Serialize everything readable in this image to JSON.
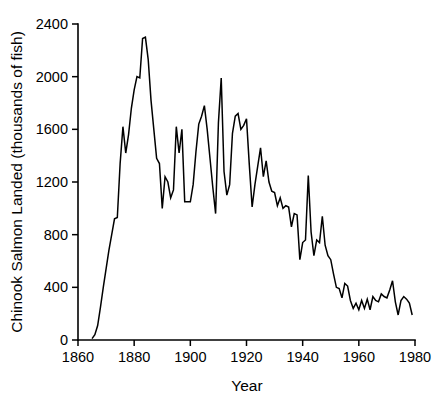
{
  "chart_data": {
    "type": "line",
    "title": "",
    "subtitle": "",
    "xlabel": "Year",
    "ylabel": "Chinook Salmon Landed (thousands of fish)",
    "xlim": [
      1860,
      1980
    ],
    "ylim": [
      0,
      2400
    ],
    "xticks": [
      1860,
      1880,
      1900,
      1920,
      1940,
      1960,
      1980
    ],
    "yticks": [
      0,
      400,
      800,
      1200,
      1600,
      2000,
      2400
    ],
    "xtick_labels": [
      "1860",
      "1880",
      "1900",
      "1920",
      "1940",
      "1960",
      "1980"
    ],
    "ytick_labels": [
      "0",
      "400",
      "800",
      "1200",
      "1600",
      "2000",
      "2400"
    ],
    "grid": false,
    "legend": null,
    "legend_position": "none",
    "line_color": "#000000",
    "background_color": "#ffffff",
    "series": [
      {
        "name": "Chinook Salmon Landed",
        "units": "thousands of fish",
        "x": [
          1865,
          1866,
          1867,
          1868,
          1869,
          1870,
          1871,
          1872,
          1873,
          1874,
          1875,
          1876,
          1877,
          1878,
          1879,
          1880,
          1881,
          1882,
          1883,
          1884,
          1885,
          1886,
          1887,
          1888,
          1889,
          1890,
          1891,
          1892,
          1893,
          1894,
          1895,
          1896,
          1897,
          1898,
          1899,
          1900,
          1901,
          1902,
          1903,
          1904,
          1905,
          1906,
          1907,
          1908,
          1909,
          1910,
          1911,
          1912,
          1913,
          1914,
          1915,
          1916,
          1917,
          1918,
          1919,
          1920,
          1921,
          1922,
          1923,
          1924,
          1925,
          1926,
          1927,
          1928,
          1929,
          1930,
          1931,
          1932,
          1933,
          1934,
          1935,
          1936,
          1937,
          1938,
          1939,
          1940,
          1941,
          1942,
          1943,
          1944,
          1945,
          1946,
          1947,
          1948,
          1949,
          1950,
          1951,
          1952,
          1953,
          1954,
          1955,
          1956,
          1957,
          1958,
          1959,
          1960,
          1961,
          1962,
          1963,
          1964,
          1965,
          1966,
          1967,
          1968,
          1969,
          1970,
          1971,
          1972,
          1973,
          1974,
          1975,
          1976,
          1977,
          1978,
          1979
        ],
        "values": [
          10,
          40,
          110,
          250,
          400,
          540,
          680,
          800,
          920,
          930,
          1340,
          1620,
          1420,
          1560,
          1760,
          1900,
          2000,
          1990,
          2290,
          2300,
          2130,
          1820,
          1600,
          1380,
          1340,
          1000,
          1240,
          1200,
          1080,
          1140,
          1620,
          1420,
          1600,
          1050,
          1050,
          1050,
          1180,
          1430,
          1640,
          1700,
          1780,
          1600,
          1380,
          1160,
          960,
          1650,
          1990,
          1280,
          1100,
          1180,
          1570,
          1700,
          1720,
          1600,
          1630,
          1680,
          1330,
          1010,
          1180,
          1320,
          1460,
          1240,
          1360,
          1200,
          1130,
          1120,
          1020,
          1080,
          1000,
          1020,
          1010,
          860,
          960,
          950,
          610,
          740,
          760,
          1250,
          820,
          640,
          760,
          740,
          940,
          720,
          640,
          610,
          500,
          400,
          390,
          320,
          430,
          410,
          300,
          240,
          280,
          230,
          300,
          240,
          310,
          230,
          330,
          300,
          290,
          350,
          330,
          320,
          380,
          450,
          290,
          190,
          300,
          330,
          310,
          280,
          190
        ]
      }
    ]
  },
  "axis": {
    "y_title": "Chinook Salmon Landed (thousands of fish)",
    "x_title": "Year"
  }
}
